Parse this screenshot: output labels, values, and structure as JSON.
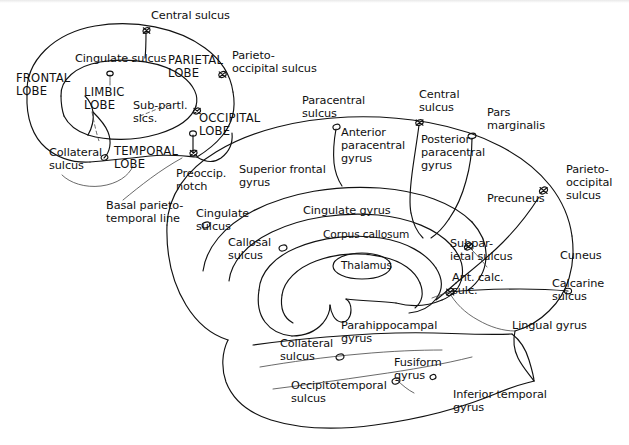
{
  "figure": {
    "type": "anatomical-line-diagram",
    "background_color": "#ffffff",
    "ink_color": "#111111"
  },
  "inset": {
    "name": "lobe-key-diagram",
    "labels": {
      "central_sulcus": "Central sulcus",
      "cingulate_sulcus": "Cingulate sulcus",
      "parietal_lobe": "PARIETAL\nLOBE",
      "parieto_occipital_sulcus": "Parieto-\noccipital sulcus",
      "frontal_lobe": "FRONTAL\nLOBE",
      "limbic_lobe": "LIMBIC\nLOBE",
      "sub_parietal_sulci": "Sub-partl.\nslcs.",
      "occipital_lobe": "OCCIPITAL\nLOBE",
      "collateral_sulcus": "Collateral\nsulcus",
      "temporal_lobe": "TEMPORAL\nLOBE",
      "preoccipital_notch": "Preoccip.\nnotch",
      "basal_parieto_temporal_line": "Basal parieto-\ntemporal line"
    }
  },
  "main": {
    "name": "medial-surface-diagram",
    "labels": {
      "paracentral_sulcus": "Paracentral\nsulcus",
      "central_sulcus": "Central\nsulcus",
      "pars_marginalis": "Pars\nmarginalis",
      "anterior_paracentral_gyrus": "Anterior\nparacentral\ngyrus",
      "posterior_paracentral_gyrus": "Posterior\nparacentral\ngyrus",
      "parieto_occipital_sulcus": "Parieto-\noccipital\nsulcus",
      "superior_frontal_gyrus": "Superior frontal\ngyrus",
      "precuneus": "Precuneus",
      "cingulate_sulcus": "Cingulate\nsulcus",
      "cingulate_gyrus": "Cingulate gyrus",
      "corpus_callosum": "Corpus callosum",
      "subparietal_sulcus": "Subpar-\nietal sulcus",
      "cuneus": "Cuneus",
      "callosal_sulcus": "Callosal\nsulcus",
      "thalamus": "Thalamus",
      "anterior_calcarine_sulcus": "Ant. calc.\nsulc.",
      "calcarine_sulcus": "Calcarine\nsulcus",
      "parahippocampal_gyrus": "Parahippocampal\ngyrus",
      "lingual_gyrus": "Lingual gyrus",
      "collateral_sulcus": "Collateral\nsulcus",
      "fusiform_gyrus": "Fusiform\ngyrus",
      "occipitotemporal_sulcus": "Occipitotemporal\nsulcus",
      "inferior_temporal_gyrus": "Inferior temporal\ngyrus"
    }
  }
}
